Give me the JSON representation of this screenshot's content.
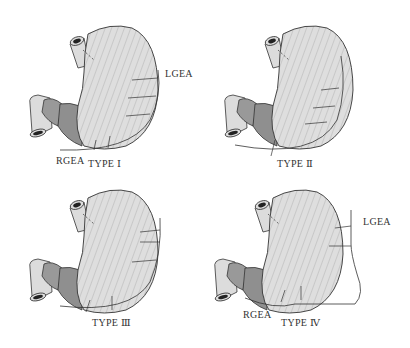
{
  "figure": {
    "panels": [
      {
        "id": "type1",
        "label": "TYPE Ⅰ",
        "lgea": "LGEA",
        "rgea": "RGEA"
      },
      {
        "id": "type2",
        "label": "TYPE Ⅱ"
      },
      {
        "id": "type3",
        "label": "TYPE Ⅲ"
      },
      {
        "id": "type4",
        "label": "TYPE Ⅳ",
        "lgea": "LGEA",
        "rgea": "RGEA"
      }
    ],
    "colors": {
      "stomach": "#dcdcdc",
      "antrum": "#9a9a9a",
      "antrum_dark": "#8a8a8a",
      "outline": "#333333"
    }
  }
}
